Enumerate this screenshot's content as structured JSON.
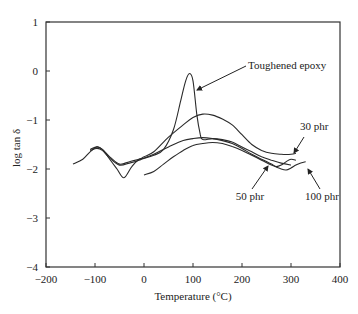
{
  "chart_data": {
    "type": "line",
    "title": "",
    "xlabel": "Temperature (°C)",
    "ylabel": "log tan δ",
    "xlim": [
      -200,
      400
    ],
    "ylim": [
      -4,
      1
    ],
    "xticks": [
      -200,
      -100,
      0,
      100,
      200,
      300,
      400
    ],
    "yticks": [
      1,
      0,
      -1,
      -2,
      -3,
      -4
    ],
    "grid": false,
    "legend": "none (curves labeled by annotations)",
    "series": [
      {
        "name": "Toughened epoxy",
        "x": [
          -145,
          -125,
          -110,
          -96,
          -85,
          -70,
          -55,
          -41,
          -25,
          -10,
          0,
          20,
          40,
          60,
          75,
          85,
          93,
          100,
          108,
          115,
          120,
          140,
          160,
          180,
          200,
          220,
          240,
          260,
          280,
          300
        ],
        "y": [
          -1.9,
          -1.8,
          -1.65,
          -1.55,
          -1.6,
          -1.8,
          -2.0,
          -2.18,
          -1.95,
          -1.8,
          -1.78,
          -1.72,
          -1.6,
          -1.2,
          -0.6,
          -0.2,
          -0.05,
          -0.2,
          -0.9,
          -1.3,
          -1.4,
          -1.38,
          -1.4,
          -1.45,
          -1.55,
          -1.65,
          -1.75,
          -1.82,
          -1.88,
          -1.92
        ]
      },
      {
        "name": "30 phr",
        "x": [
          -110,
          -96,
          -85,
          -70,
          -50,
          -30,
          -10,
          0,
          20,
          50,
          80,
          100,
          120,
          140,
          160,
          180,
          200,
          220,
          240,
          260,
          280,
          300,
          310
        ],
        "y": [
          -1.6,
          -1.55,
          -1.6,
          -1.75,
          -1.9,
          -1.85,
          -1.8,
          -1.75,
          -1.65,
          -1.35,
          -1.1,
          -0.95,
          -0.88,
          -0.9,
          -0.98,
          -1.1,
          -1.3,
          -1.5,
          -1.62,
          -1.68,
          -1.7,
          -1.7,
          -1.68
        ]
      },
      {
        "name": "50 phr",
        "x": [
          -110,
          -96,
          -85,
          -70,
          -50,
          -30,
          -10,
          0,
          20,
          50,
          80,
          100,
          120,
          140,
          160,
          180,
          200,
          220,
          240,
          260,
          270,
          280,
          290,
          300,
          310
        ],
        "y": [
          -1.62,
          -1.58,
          -1.62,
          -1.78,
          -1.92,
          -1.88,
          -1.82,
          -1.78,
          -1.7,
          -1.55,
          -1.42,
          -1.38,
          -1.36,
          -1.38,
          -1.42,
          -1.48,
          -1.58,
          -1.7,
          -1.8,
          -1.9,
          -1.95,
          -1.92,
          -1.85,
          -1.8,
          -1.82
        ]
      },
      {
        "name": "100 phr",
        "x": [
          0,
          20,
          40,
          60,
          80,
          100,
          120,
          140,
          160,
          180,
          200,
          220,
          240,
          260,
          280,
          290,
          300,
          310,
          320,
          330
        ],
        "y": [
          -2.12,
          -2.05,
          -1.9,
          -1.75,
          -1.62,
          -1.52,
          -1.48,
          -1.46,
          -1.48,
          -1.54,
          -1.62,
          -1.72,
          -1.82,
          -1.92,
          -2.0,
          -2.02,
          -1.98,
          -1.92,
          -1.88,
          -1.85
        ]
      }
    ],
    "annotations": [
      {
        "text": "Toughened epoxy",
        "arrow_to": [
          100,
          -0.3
        ]
      },
      {
        "text": "30 phr",
        "arrow_to": [
          300,
          -1.7
        ]
      },
      {
        "text": "50 phr",
        "arrow_to": [
          290,
          -1.88
        ]
      },
      {
        "text": "100 phr",
        "arrow_to": [
          315,
          -1.92
        ]
      }
    ]
  },
  "labels": {
    "xlabel": "Temperature (°C)",
    "ylabel": "log tan δ",
    "annotations": [
      "Toughened epoxy",
      "30 phr",
      "50 phr",
      "100 phr"
    ],
    "xticks": [
      "−200",
      "−100",
      "0",
      "100",
      "200",
      "300",
      "400"
    ],
    "yticks": [
      "1",
      "0",
      "−1",
      "−2",
      "−3",
      "−4"
    ]
  }
}
